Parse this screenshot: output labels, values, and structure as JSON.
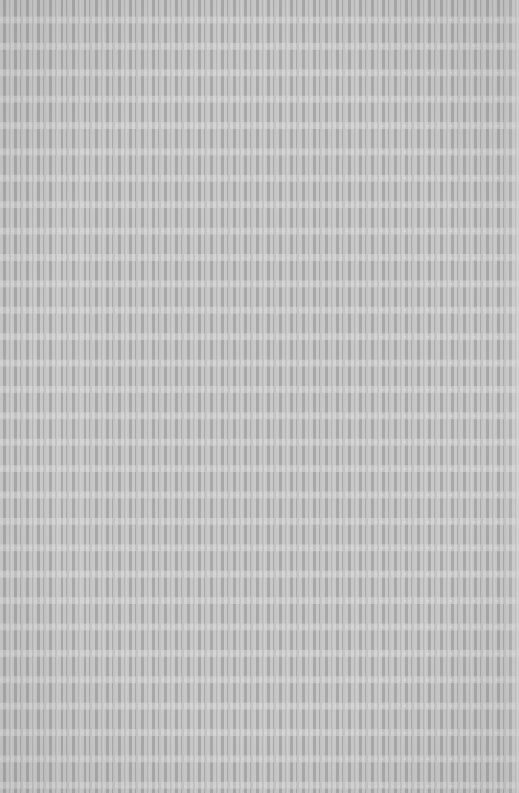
{
  "image": {
    "description": "Uniform gray grid texture of small rectangular cells",
    "colors": {
      "cell_fill": "#a8a8a8",
      "grid_line": "#c4c4c4",
      "band_line": "#c2c2c2",
      "dash_highlight": "#d6d6d6"
    },
    "grid": {
      "column_period_px": 11.5,
      "row_period_px": 26.4,
      "approx_columns": 45,
      "approx_rows": 30
    }
  }
}
